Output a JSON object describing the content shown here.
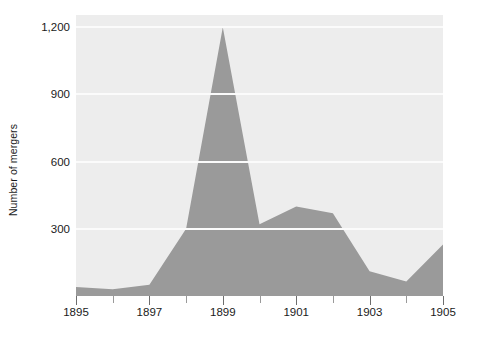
{
  "chart_data": {
    "type": "area",
    "title": "",
    "xlabel": "",
    "ylabel": "Number of mergers",
    "x": [
      1895,
      1896,
      1897,
      1898,
      1899,
      1900,
      1901,
      1902,
      1903,
      1904,
      1905
    ],
    "values": [
      40,
      30,
      50,
      300,
      1200,
      320,
      400,
      370,
      110,
      65,
      230
    ],
    "series": [
      {
        "name": "Number of mergers",
        "values": [
          40,
          30,
          50,
          300,
          1200,
          320,
          400,
          370,
          110,
          65,
          230
        ]
      }
    ],
    "xlim": [
      1895,
      1905
    ],
    "ylim": [
      0,
      1255
    ],
    "ytick_values": [
      300,
      600,
      900,
      1200
    ],
    "ytick_labels": [
      "300",
      "600",
      "900",
      "1,200"
    ],
    "xtick_values": [
      1895,
      1896,
      1897,
      1898,
      1899,
      1900,
      1901,
      1902,
      1903,
      1904,
      1905
    ],
    "xtick_labels": [
      "1895",
      "",
      "1897",
      "",
      "1899",
      "",
      "1901",
      "",
      "1903",
      "",
      "1905"
    ],
    "xtick_major": [
      1895,
      1897,
      1899,
      1901,
      1903,
      1905
    ],
    "grid": true,
    "grid_axis": "y",
    "legend": false,
    "legend_position": "none",
    "colors": {
      "area_fill": "#9a9a9a",
      "plot_background": "#ededed",
      "gridline": "#fbfbfb",
      "figure_background": "#ffffff",
      "text": "#1a1a1a",
      "tick_mark": "#6e6e6e"
    }
  }
}
